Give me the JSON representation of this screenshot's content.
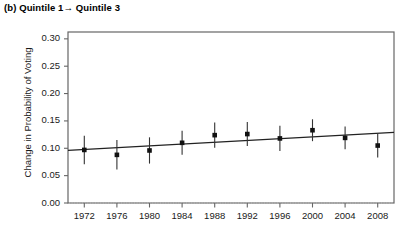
{
  "chart_data": {
    "type": "scatter",
    "title": "(b) Quintile 1→ Quintile 3",
    "xlabel": "",
    "ylabel": "Change in Probability of Voting",
    "x": [
      1972,
      1976,
      1980,
      1984,
      1988,
      1992,
      1996,
      2000,
      2004,
      2008
    ],
    "xtick_labels": [
      "1972",
      "1976",
      "1980",
      "1984",
      "1988",
      "1992",
      "1996",
      "2000",
      "2004",
      "2008"
    ],
    "values": [
      0.097,
      0.088,
      0.096,
      0.11,
      0.124,
      0.126,
      0.118,
      0.133,
      0.119,
      0.105
    ],
    "error_lower": [
      0.071,
      0.061,
      0.072,
      0.088,
      0.101,
      0.104,
      0.095,
      0.113,
      0.098,
      0.083
    ],
    "error_upper": [
      0.123,
      0.115,
      0.12,
      0.132,
      0.147,
      0.148,
      0.141,
      0.153,
      0.14,
      0.127
    ],
    "ytick_labels": [
      "0.00",
      "0.05",
      "0.10",
      "0.15",
      "0.20",
      "0.25",
      "0.30"
    ],
    "ytick_values": [
      0.0,
      0.05,
      0.1,
      0.15,
      0.2,
      0.25,
      0.3
    ],
    "ylim": [
      0.0,
      0.3125
    ],
    "xlim": [
      1970,
      2010
    ],
    "grid": false,
    "legend": "none",
    "reference_line": {
      "y": 0.0,
      "style": "dotted"
    },
    "trend_line": {
      "y_start": 0.096,
      "y_end": 0.129,
      "style": "solid"
    },
    "marker": {
      "shape": "square",
      "color": "#111111"
    },
    "line_color": "#222222",
    "frame_color": "#666666",
    "axis_text_color": "#1a1a1a"
  }
}
